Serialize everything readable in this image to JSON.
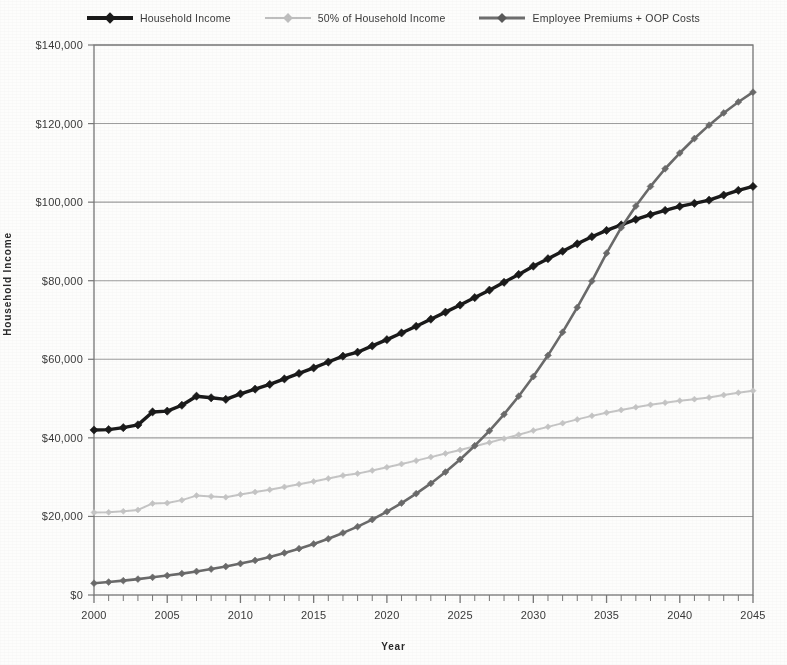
{
  "chart_data": {
    "type": "line",
    "title": "",
    "xlabel": "Year",
    "ylabel": "Household Income",
    "xlim": [
      2000,
      2045
    ],
    "ylim": [
      0,
      140000
    ],
    "ytick_step": 20000,
    "xtick_step": 1,
    "xlabel_step": 5,
    "grid": "horizontal",
    "legend_position": "top-center",
    "y_tick_labels": [
      "$0",
      "$20,000",
      "$40,000",
      "$60,000",
      "$80,000",
      "$100,000",
      "$120,000",
      "$140,000"
    ],
    "y_tick_values": [
      0,
      20000,
      40000,
      60000,
      80000,
      100000,
      120000,
      140000
    ],
    "x_tick_labels": [
      "2000",
      "2005",
      "2010",
      "2015",
      "2020",
      "2025",
      "2030",
      "2035",
      "2040",
      "2045"
    ],
    "x_tick_values": [
      2000,
      2005,
      2010,
      2015,
      2020,
      2025,
      2030,
      2035,
      2040,
      2045
    ],
    "x": [
      2000,
      2001,
      2002,
      2003,
      2004,
      2005,
      2006,
      2007,
      2008,
      2009,
      2010,
      2011,
      2012,
      2013,
      2014,
      2015,
      2016,
      2017,
      2018,
      2019,
      2020,
      2021,
      2022,
      2023,
      2024,
      2025,
      2026,
      2027,
      2028,
      2029,
      2030,
      2031,
      2032,
      2033,
      2034,
      2035,
      2036,
      2037,
      2038,
      2039,
      2040,
      2041,
      2042,
      2043,
      2044,
      2045
    ],
    "series": [
      {
        "name": "Household Income",
        "color": "#1c1c1c",
        "marker": "diamond",
        "line_width": 3.4,
        "values": [
          42000,
          42100,
          42600,
          43300,
          46600,
          46800,
          48300,
          50600,
          50200,
          49800,
          51200,
          52400,
          53600,
          55000,
          56400,
          57800,
          59300,
          60800,
          61800,
          63400,
          65000,
          66700,
          68400,
          70200,
          72000,
          73800,
          75700,
          77600,
          79600,
          81600,
          83700,
          85600,
          87500,
          89400,
          91200,
          92800,
          94200,
          95600,
          96800,
          97900,
          98900,
          99700,
          100500,
          101800,
          103000,
          104000
        ]
      },
      {
        "name": "50% of Household Income",
        "color": "#c4c4c4",
        "marker": "diamond",
        "line_width": 2.0,
        "values": [
          21000,
          21050,
          21300,
          21650,
          23300,
          23400,
          24150,
          25300,
          25100,
          24900,
          25600,
          26200,
          26800,
          27500,
          28200,
          28900,
          29650,
          30400,
          30900,
          31700,
          32500,
          33350,
          34200,
          35100,
          36000,
          36900,
          37850,
          38800,
          39800,
          40800,
          41850,
          42800,
          43750,
          44700,
          45600,
          46400,
          47100,
          47800,
          48400,
          48950,
          49450,
          49850,
          50250,
          50900,
          51500,
          52000
        ]
      },
      {
        "name": "Employee Premiums + OOP Costs",
        "color": "#6a6a6a",
        "marker": "diamond",
        "line_width": 2.6,
        "values": [
          3000,
          3300,
          3650,
          4050,
          4500,
          4950,
          5450,
          6000,
          6600,
          7250,
          8000,
          8800,
          9700,
          10700,
          11800,
          13000,
          14300,
          15800,
          17400,
          19200,
          21200,
          23400,
          25800,
          28400,
          31300,
          34500,
          38000,
          41800,
          46000,
          50600,
          55600,
          61000,
          66900,
          73200,
          79900,
          87000,
          93500,
          99000,
          104000,
          108500,
          112500,
          116200,
          119600,
          122700,
          125500,
          128000
        ]
      }
    ],
    "annotations": [
      "Employee Premiums + OOP Costs crosses 50% of Household Income near 2031",
      "Employee Premiums + OOP Costs crosses Household Income near 2042 at about $100,000"
    ]
  },
  "legend": {
    "items": [
      {
        "label": "Household Income",
        "swatch": "s-income"
      },
      {
        "label": "50% of Household Income",
        "swatch": "s-half"
      },
      {
        "label": "Employee Premiums + OOP Costs",
        "swatch": "s-prem"
      }
    ]
  },
  "axes": {
    "y_title": "Household Income",
    "x_title": "Year"
  },
  "colors": {
    "income": "#1c1c1c",
    "half": "#c4c4c4",
    "premiums": "#6a6a6a",
    "grid": "#8d8d8d",
    "axis": "#777777",
    "text": "#3a3a3a"
  }
}
